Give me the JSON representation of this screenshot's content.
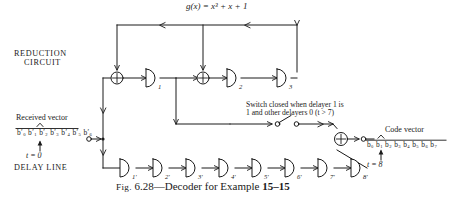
{
  "figure": {
    "caption_prefix": "Fig.",
    "caption_number": "6.28",
    "caption_dash": "—",
    "caption_text": "Decoder for Example",
    "caption_example": "15–15",
    "generator_polynomial": "g(x) = x³ + x + 1"
  },
  "labels": {
    "reduction_line1": "REDUCTION",
    "reduction_line2": "CIRCUIT",
    "delay_line": "DELAY LINE",
    "received_vector": "Received vector",
    "code_vector": "Code vector",
    "time_start": "t = 0",
    "time_end": "t = 8",
    "switch_line1": "Switch closed when delayer 1 is",
    "switch_line2": "1 and other delayers 0 (t > 7)"
  },
  "received_bits": [
    "b′0",
    "b′1",
    "b′2",
    "b′3",
    "b′4",
    "b′5",
    "b′6"
  ],
  "code_bits": [
    "b0",
    "b1",
    "b2",
    "b3",
    "b4",
    "b5",
    "b6",
    "b7"
  ],
  "reduction_delayers": [
    {
      "label": "1",
      "x": 148,
      "y": 78
    },
    {
      "label": "2",
      "x": 229,
      "y": 78
    },
    {
      "label": "3",
      "x": 279,
      "y": 78
    }
  ],
  "reduction_adders": [
    {
      "name": "adder-input",
      "cx": 117,
      "cy": 78
    },
    {
      "name": "adder-mid",
      "cx": 203,
      "cy": 78
    }
  ],
  "delay_line_delayers": [
    {
      "label": "1′",
      "x": 122
    },
    {
      "label": "2′",
      "x": 155
    },
    {
      "label": "3′",
      "x": 188
    },
    {
      "label": "4′",
      "x": 221
    },
    {
      "label": "5′",
      "x": 254
    },
    {
      "label": "6′",
      "x": 287
    },
    {
      "label": "7′",
      "x": 320
    },
    {
      "label": "8′",
      "x": 353
    }
  ],
  "output_adder": {
    "name": "adder-output",
    "cx": 341,
    "cy": 139
  },
  "colors": {
    "ink": "#1a1a1a",
    "paper": "#ffffff"
  }
}
